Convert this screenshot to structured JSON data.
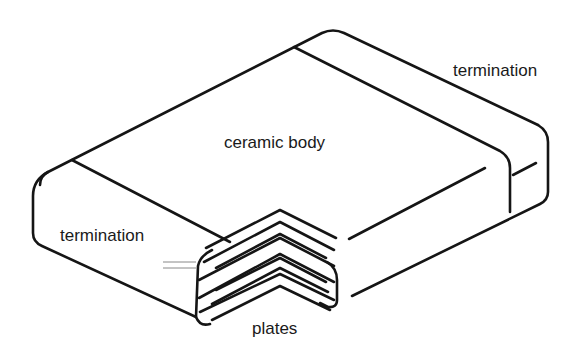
{
  "diagram": {
    "line_color": "#151515",
    "background": "#ffffff",
    "labels": {
      "termination_right": "termination",
      "ceramic_body": "ceramic body",
      "termination_left": "termination",
      "plates": "plates"
    }
  }
}
